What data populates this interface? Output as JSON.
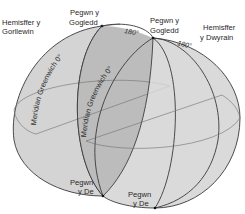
{
  "colors": {
    "background": "#ffffff",
    "sphere_fill": "#d4d4d4",
    "lens_fill": "#bcbcbc",
    "line": "#3a3a3a",
    "grid_line": "#6e6e6e",
    "text": "#2a2a2a"
  },
  "labels": {
    "western_hemisphere_line1": "Hemisffer y",
    "western_hemisphere_line2": "Gorllewin",
    "eastern_hemisphere_line1": "Hemisffer",
    "eastern_hemisphere_line2": "y Dwyrain",
    "north_pole_west_line1": "Pegwn y",
    "north_pole_west_line2": "Gogledd",
    "north_pole_east_line1": "Pegwn y",
    "north_pole_east_line2": "Gogledd",
    "south_pole_west_line1": "Pegwn",
    "south_pole_west_line2": "y De",
    "south_pole_east_line1": "Pegwn",
    "south_pole_east_line2": "y De",
    "meridian_west": "Meridian Greenwich 0°",
    "meridian_east": "Meridian Greenwich 0°",
    "antimeridian_west": "180°",
    "antimeridian_east": "180°"
  }
}
